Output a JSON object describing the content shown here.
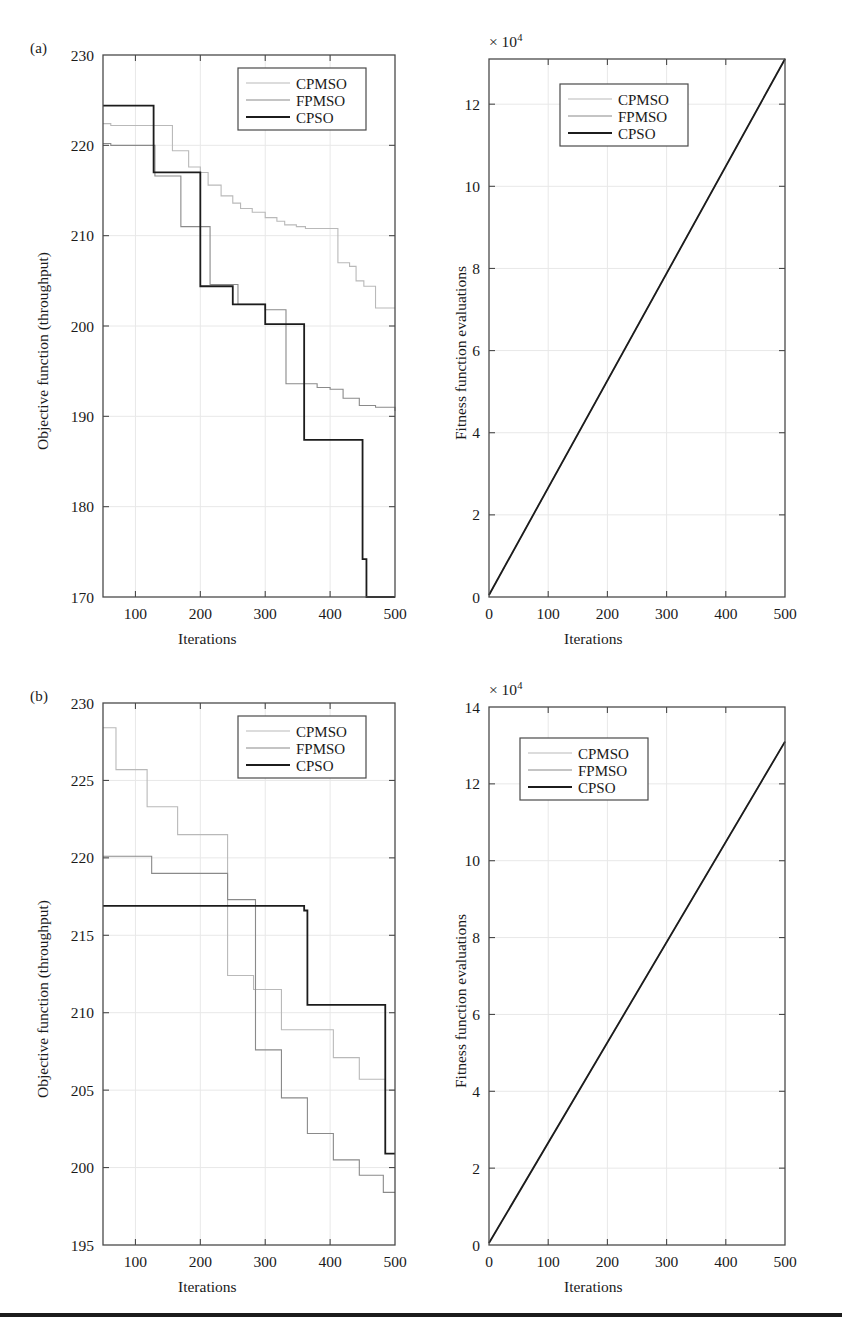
{
  "figure": {
    "panels": [
      {
        "tag": "(a)",
        "left_chart": {
          "ylabel": "Objective function (throughput)",
          "xlabel": "Iterations",
          "xticks": [
            "100",
            "200",
            "300",
            "400",
            "500"
          ],
          "yticks": [
            "170",
            "180",
            "190",
            "200",
            "210",
            "220",
            "230"
          ],
          "legend": [
            "CPMSO",
            "FPMSO",
            "CPSO"
          ]
        },
        "right_chart": {
          "ylabel": "Fitness function evaluations",
          "xlabel": "Iterations",
          "multiplier": "× 10",
          "multiplier_exp": "4",
          "xticks": [
            "0",
            "100",
            "200",
            "300",
            "400",
            "500"
          ],
          "yticks": [
            "0",
            "2",
            "4",
            "6",
            "8",
            "10",
            "12"
          ],
          "legend": [
            "CPMSO",
            "FPMSO",
            "CPSO"
          ]
        }
      },
      {
        "tag": "(b)",
        "left_chart": {
          "ylabel": "Objective function (throughput)",
          "xlabel": "Iterations",
          "xticks": [
            "100",
            "200",
            "300",
            "400",
            "500"
          ],
          "yticks": [
            "195",
            "200",
            "205",
            "210",
            "215",
            "220",
            "225",
            "230"
          ],
          "legend": [
            "CPMSO",
            "FPMSO",
            "CPSO"
          ]
        },
        "right_chart": {
          "ylabel": "Fitness function evaluations",
          "xlabel": "Iterations",
          "multiplier": "× 10",
          "multiplier_exp": "4",
          "xticks": [
            "0",
            "100",
            "200",
            "300",
            "400",
            "500"
          ],
          "yticks": [
            "0",
            "2",
            "4",
            "6",
            "8",
            "10",
            "12",
            "14"
          ],
          "legend": [
            "CPMSO",
            "FPMSO",
            "CPSO"
          ]
        }
      }
    ]
  },
  "colors": {
    "cpmso": "#b9b9b9",
    "fpmso": "#8a8a8a",
    "cpso": "#1c1c1c",
    "axis": "#4a4a4a",
    "grid": "#e8e8e8",
    "background": "#ffffff",
    "rule": "#1c1c1c"
  },
  "chart_data": [
    {
      "id": "a-left",
      "type": "line",
      "subtype": "step",
      "panel": "(a)",
      "position": "top-left",
      "title": "",
      "xlabel": "Iterations",
      "ylabel": "Objective function (throughput)",
      "xlim": [
        50,
        500
      ],
      "ylim": [
        170,
        230
      ],
      "xticks": [
        100,
        200,
        300,
        400,
        500
      ],
      "yticks": [
        170,
        180,
        190,
        200,
        210,
        220,
        230
      ],
      "grid": true,
      "legend_position": "upper-right",
      "series": [
        {
          "name": "CPMSO",
          "color": "#b9b9b9",
          "x": [
            50,
            60,
            62,
            132,
            157,
            182,
            200,
            212,
            232,
            250,
            262,
            280,
            300,
            318,
            330,
            348,
            362,
            380,
            400,
            412,
            430,
            440,
            452,
            470,
            500
          ],
          "y": [
            222.4,
            222.4,
            222.2,
            222.2,
            219.4,
            217.6,
            217.0,
            215.6,
            214.4,
            213.6,
            213.0,
            212.6,
            212.0,
            211.6,
            211.2,
            211.0,
            210.8,
            210.8,
            210.8,
            207.0,
            206.6,
            205.0,
            204.4,
            202.0,
            202.0
          ]
        },
        {
          "name": "FPMSO",
          "color": "#8a8a8a",
          "x": [
            50,
            60,
            62,
            118,
            130,
            155,
            170,
            200,
            215,
            240,
            258,
            280,
            300,
            320,
            332,
            360,
            380,
            400,
            420,
            445,
            470,
            500
          ],
          "y": [
            220.2,
            220.2,
            220.0,
            220.0,
            216.6,
            216.6,
            211.0,
            211.0,
            204.6,
            204.6,
            202.4,
            202.4,
            201.8,
            201.8,
            193.6,
            193.6,
            193.2,
            193.0,
            192.0,
            191.2,
            191.0,
            190.6
          ]
        },
        {
          "name": "CPSO",
          "color": "#1c1c1c",
          "x": [
            50,
            60,
            62,
            118,
            128,
            155,
            200,
            232,
            250,
            280,
            300,
            330,
            360,
            400,
            418,
            430,
            450,
            456,
            500
          ],
          "y": [
            224.4,
            224.4,
            224.4,
            224.4,
            217.0,
            217.0,
            204.4,
            204.4,
            202.4,
            202.4,
            200.2,
            200.2,
            187.4,
            187.4,
            187.4,
            187.4,
            174.2,
            170.0,
            170.0
          ]
        }
      ]
    },
    {
      "id": "a-right",
      "type": "line",
      "panel": "(a)",
      "position": "top-right",
      "title": "",
      "xlabel": "Iterations",
      "ylabel": "Fitness function evaluations",
      "y_multiplier": "× 10^4",
      "xlim": [
        0,
        500
      ],
      "ylim": [
        0,
        13.1
      ],
      "xticks": [
        0,
        100,
        200,
        300,
        400,
        500
      ],
      "yticks": [
        0,
        2,
        4,
        6,
        8,
        10,
        12
      ],
      "grid": true,
      "legend_position": "upper-center",
      "series": [
        {
          "name": "CPMSO",
          "color": "#b9b9b9",
          "x": [
            0,
            500
          ],
          "y": [
            0.05,
            13.1
          ]
        },
        {
          "name": "FPMSO",
          "color": "#8a8a8a",
          "x": [
            0,
            500
          ],
          "y": [
            0.05,
            13.1
          ]
        },
        {
          "name": "CPSO",
          "color": "#1c1c1c",
          "x": [
            0,
            500
          ],
          "y": [
            0.05,
            13.1
          ]
        }
      ]
    },
    {
      "id": "b-left",
      "type": "line",
      "subtype": "step",
      "panel": "(b)",
      "position": "bottom-left",
      "title": "",
      "xlabel": "Iterations",
      "ylabel": "Objective function (throughput)",
      "xlim": [
        50,
        500
      ],
      "ylim": [
        195,
        230
      ],
      "xticks": [
        100,
        200,
        300,
        400,
        500
      ],
      "yticks": [
        195,
        200,
        205,
        210,
        215,
        220,
        225,
        230
      ],
      "grid": true,
      "legend_position": "upper-right",
      "series": [
        {
          "name": "CPMSO",
          "color": "#b9b9b9",
          "x": [
            50,
            68,
            70,
            112,
            118,
            160,
            165,
            238,
            242,
            278,
            282,
            320,
            325,
            360,
            365,
            400,
            405,
            440,
            445,
            480,
            485,
            500
          ],
          "y": [
            228.4,
            228.4,
            225.7,
            225.7,
            223.3,
            223.3,
            221.5,
            221.5,
            212.4,
            212.4,
            211.5,
            211.5,
            208.9,
            208.9,
            208.9,
            208.9,
            207.1,
            207.1,
            205.7,
            205.7,
            205.0,
            205.0
          ]
        },
        {
          "name": "FPMSO",
          "color": "#8a8a8a",
          "x": [
            50,
            120,
            125,
            238,
            242,
            280,
            285,
            320,
            325,
            360,
            365,
            400,
            405,
            440,
            445,
            478,
            482,
            500
          ],
          "y": [
            220.1,
            220.1,
            219.0,
            219.0,
            217.3,
            217.3,
            207.6,
            207.6,
            204.5,
            204.5,
            202.2,
            202.2,
            200.5,
            200.5,
            199.5,
            199.5,
            198.4,
            198.4
          ]
        },
        {
          "name": "CPSO",
          "color": "#1c1c1c",
          "x": [
            50,
            100,
            200,
            300,
            355,
            360,
            362,
            365,
            368,
            480,
            485,
            500
          ],
          "y": [
            216.9,
            216.9,
            216.9,
            216.9,
            216.9,
            216.6,
            216.6,
            210.5,
            210.5,
            210.5,
            200.9,
            200.9
          ]
        }
      ]
    },
    {
      "id": "b-right",
      "type": "line",
      "panel": "(b)",
      "position": "bottom-right",
      "title": "",
      "xlabel": "Iterations",
      "ylabel": "Fitness function evaluations",
      "y_multiplier": "× 10^4",
      "xlim": [
        0,
        500
      ],
      "ylim": [
        0,
        14
      ],
      "xticks": [
        0,
        100,
        200,
        300,
        400,
        500
      ],
      "yticks": [
        0,
        2,
        4,
        6,
        8,
        10,
        12,
        14
      ],
      "grid": true,
      "legend_position": "upper-left",
      "series": [
        {
          "name": "CPMSO",
          "color": "#b9b9b9",
          "x": [
            0,
            500
          ],
          "y": [
            0.05,
            13.1
          ]
        },
        {
          "name": "FPMSO",
          "color": "#8a8a8a",
          "x": [
            0,
            500
          ],
          "y": [
            0.05,
            13.1
          ]
        },
        {
          "name": "CPSO",
          "color": "#1c1c1c",
          "x": [
            0,
            500
          ],
          "y": [
            0.05,
            13.1
          ]
        }
      ]
    }
  ]
}
